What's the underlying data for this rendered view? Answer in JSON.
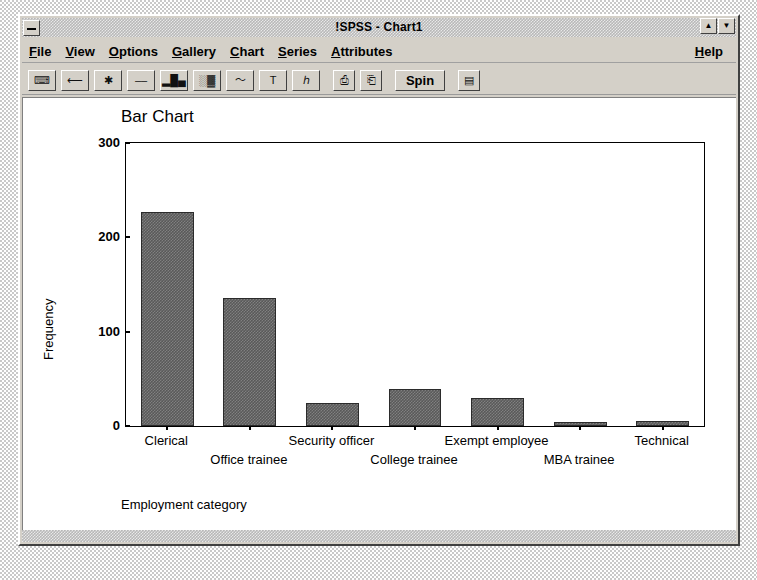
{
  "window": {
    "title": "!SPSS - Chart1",
    "system_menu_icon": "minimize-icon",
    "restore_icon": "restore-icon",
    "maximize_icon": "maximize-icon"
  },
  "menubar": {
    "items": [
      {
        "label": "File",
        "mnemonic": "F"
      },
      {
        "label": "View",
        "mnemonic": "V"
      },
      {
        "label": "Options",
        "mnemonic": "O"
      },
      {
        "label": "Gallery",
        "mnemonic": "G"
      },
      {
        "label": "Chart",
        "mnemonic": "C"
      },
      {
        "label": "Series",
        "mnemonic": "S"
      },
      {
        "label": "Attributes",
        "mnemonic": "A"
      }
    ],
    "help": {
      "label": "Help",
      "mnemonic": "H"
    }
  },
  "toolbar": {
    "buttons": [
      {
        "name": "keyboard-icon",
        "glyph": "⌨"
      },
      {
        "name": "arrow-left-icon",
        "glyph": "⟵"
      },
      {
        "name": "asterisk-icon",
        "glyph": "✱"
      },
      {
        "name": "dashed-line-icon",
        "glyph": "––"
      },
      {
        "name": "bar-chart-icon",
        "glyph": "▐█▌"
      },
      {
        "name": "stacked-chart-icon",
        "glyph": "▒▓"
      },
      {
        "name": "line-chart-icon",
        "glyph": "〜"
      },
      {
        "name": "text-tool-icon",
        "glyph": "T"
      },
      {
        "name": "three-d-axis-icon",
        "glyph": "⅄"
      },
      {
        "name": "copy-icon",
        "glyph": "⎙"
      },
      {
        "name": "paste-icon",
        "glyph": "⌗"
      },
      {
        "name": "spin-button",
        "label": "Spin"
      },
      {
        "name": "data-sheet-icon",
        "glyph": "☰"
      }
    ],
    "spin_label": "Spin"
  },
  "chart_data": {
    "type": "bar",
    "title": "Bar Chart",
    "xlabel": "Employment category",
    "ylabel": "Frequency",
    "categories": [
      "Clerical",
      "Office trainee",
      "Security officer",
      "College trainee",
      "Exempt employee",
      "MBA trainee",
      "Technical"
    ],
    "values": [
      227,
      136,
      24,
      39,
      30,
      4,
      5
    ],
    "yticks": [
      0,
      100,
      200,
      300
    ],
    "ylim": [
      0,
      300
    ],
    "grid": false,
    "legend": false,
    "bar_color": "#595959"
  }
}
